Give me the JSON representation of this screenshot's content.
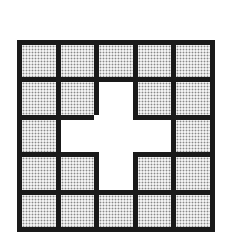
{
  "diagram": {
    "type": "grid",
    "rows": 5,
    "cols": 5,
    "colors": {
      "border": "#1a1a1a",
      "filled": "#bdbdbd",
      "empty": "#ffffff"
    },
    "cells": [
      [
        "dotted",
        "dotted",
        "dotted",
        "dotted",
        "dotted"
      ],
      [
        "dotted",
        "dotted",
        "empty",
        "dotted",
        "dotted"
      ],
      [
        "dotted",
        "empty",
        "empty",
        "empty",
        "dotted"
      ],
      [
        "dotted",
        "dotted",
        "empty",
        "dotted",
        "dotted"
      ],
      [
        "dotted",
        "dotted",
        "dotted",
        "dotted",
        "dotted"
      ]
    ]
  }
}
